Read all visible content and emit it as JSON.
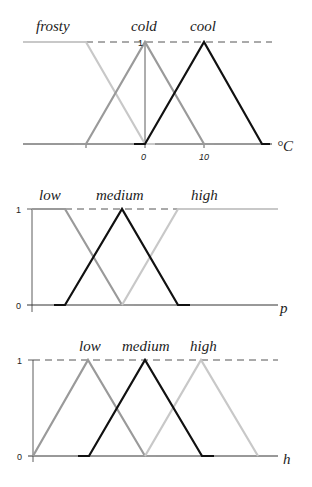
{
  "charts": [
    {
      "id": "temperature",
      "axis_label": "°C",
      "y_tick_top": "1",
      "x_ticks": [
        "0",
        "10"
      ],
      "sets": [
        {
          "name": "frosty",
          "color": "#c8c8c8"
        },
        {
          "name": "cold",
          "color": "#9a9a9a"
        },
        {
          "name": "cool",
          "color": "#111111"
        }
      ]
    },
    {
      "id": "p",
      "axis_label": "p",
      "y_tick_top": "1",
      "y_tick_bottom": "0",
      "sets": [
        {
          "name": "low",
          "color": "#9a9a9a"
        },
        {
          "name": "medium",
          "color": "#111111"
        },
        {
          "name": "high",
          "color": "#c8c8c8"
        }
      ]
    },
    {
      "id": "h",
      "axis_label": "h",
      "y_tick_top": "1",
      "y_tick_bottom": "0",
      "sets": [
        {
          "name": "low",
          "color": "#9a9a9a"
        },
        {
          "name": "medium",
          "color": "#111111"
        },
        {
          "name": "high",
          "color": "#c8c8c8"
        }
      ]
    }
  ]
}
